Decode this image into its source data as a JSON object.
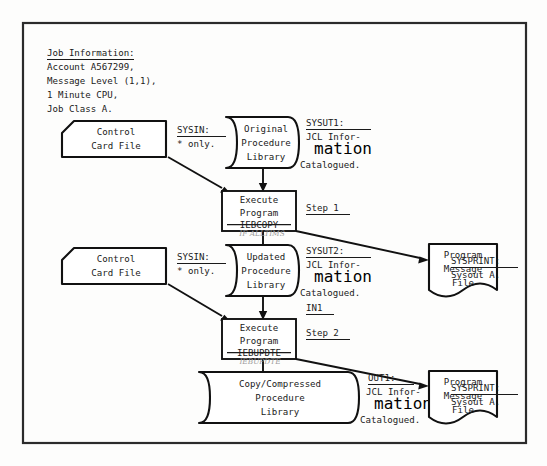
{
  "document": {
    "title": "JCL Job Flow Diagram",
    "frame": {
      "x": 22,
      "y": 22,
      "width": 505,
      "height": 422
    }
  },
  "job_information": {
    "heading": "Job Information:",
    "lines": [
      "Account A567299,",
      "Message Level (1,1),",
      "1 Minute CPU,",
      "Job Class A."
    ]
  },
  "nodes": {
    "control_card_1": {
      "lines": [
        "Control",
        "Card File"
      ],
      "shape": "punched-card"
    },
    "control_card_2": {
      "lines": [
        "Control",
        "Card File"
      ],
      "shape": "punched-card"
    },
    "original_library": {
      "lines": [
        "Original",
        "Procedure",
        "Library"
      ],
      "shape": "stored-data"
    },
    "updated_library": {
      "lines": [
        "Updated",
        "Procedure",
        "Library"
      ],
      "shape": "stored-data"
    },
    "copy_library": {
      "lines": [
        "Copy/Compressed",
        "Procedure",
        "Library"
      ],
      "shape": "stored-data"
    },
    "step1_process": {
      "lines": [
        "Execute",
        "Program"
      ],
      "struck_line": "IEBCOPY",
      "handwriting": "IF ALLTIMS",
      "shape": "process"
    },
    "step2_process": {
      "lines": [
        "Execute",
        "Program"
      ],
      "struck_line": "IEBUPDTE",
      "handwriting": "IEBUPDTE",
      "shape": "process"
    },
    "message_file_1": {
      "lines": [
        "Program",
        "Message",
        "File"
      ],
      "shape": "document"
    },
    "message_file_2": {
      "lines": [
        "Program",
        "Message",
        "File"
      ],
      "shape": "document"
    }
  },
  "annotations": {
    "sysin_1": {
      "heading": "SYSIN:",
      "lines": [
        "* only."
      ]
    },
    "sysin_2": {
      "heading": "SYSIN:",
      "lines": [
        "* only."
      ]
    },
    "sysut1": {
      "heading": "SYSUT1:",
      "lines": [
        "JCL Infor-",
        "mation",
        "Catalogued."
      ]
    },
    "sysut2": {
      "heading": "SYSUT2:",
      "lines": [
        "JCL Infor-",
        "mation",
        "Catalogued."
      ]
    },
    "out1": {
      "heading": "OUT1:",
      "lines": [
        "JCL Infor-",
        "mation",
        "Catalogued."
      ]
    },
    "sysprint_1": {
      "heading": "SYSPRINT:",
      "lines": [
        "Sysout A."
      ]
    },
    "sysprint_2": {
      "heading": "SYSPRINT:",
      "lines": [
        "Sysout A."
      ]
    },
    "in1": {
      "heading": "IN1",
      "lines": []
    },
    "step1": {
      "heading": "Step 1",
      "lines": []
    },
    "step2": {
      "heading": "Step 2",
      "lines": []
    }
  },
  "colors": {
    "ink": "#111111",
    "paper": "#fdfdfc",
    "frame": "#2b2b2b",
    "handwriting": "#9a9a9a"
  }
}
